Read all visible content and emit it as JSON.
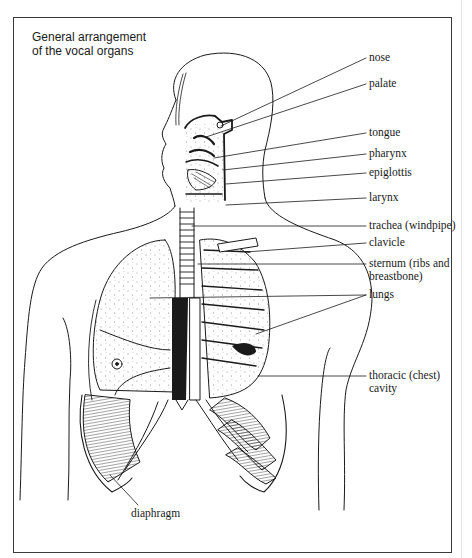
{
  "title": {
    "line1": "General arrangement",
    "line2": "of the vocal organs"
  },
  "labels": {
    "nose": "nose",
    "palate": "palate",
    "tongue": "tongue",
    "pharynx": "pharynx",
    "epiglottis": "epiglottis",
    "larynx": "larynx",
    "trachea": "trachea (windpipe)",
    "clavicle": "clavicle",
    "sternum_line1": "sternum (ribs and",
    "sternum_line2": "breastbone)",
    "lungs": "lungs",
    "thoracic_line1": "thoracic (chest)",
    "thoracic_line2": "cavity",
    "diaphragm": "diaphragm"
  },
  "colors": {
    "ink": "#1a1a1a",
    "frame": "#3a3a3a",
    "background": "#ffffff"
  }
}
